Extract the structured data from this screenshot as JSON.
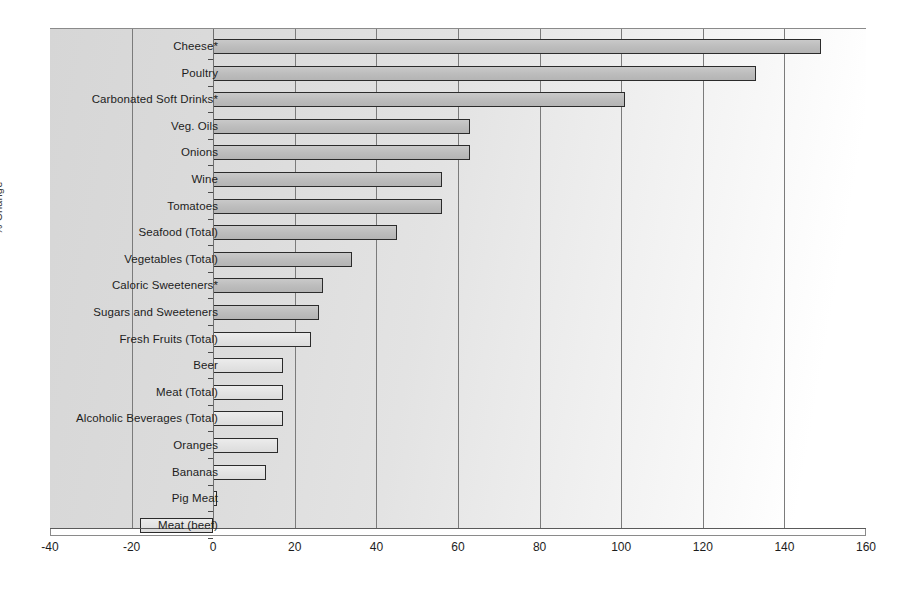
{
  "chart_data": {
    "type": "bar",
    "orientation": "horizontal",
    "title": "",
    "xlabel": "",
    "ylabel": "% Change",
    "xlim": [
      -40,
      160
    ],
    "xticks": [
      -40,
      -20,
      0,
      20,
      40,
      60,
      80,
      100,
      120,
      140,
      160
    ],
    "grid": true,
    "legend": false,
    "categories": [
      "Cheese*",
      "Poultry",
      "Carbonated Soft Drinks*",
      "Veg. Oils",
      "Onions",
      "Wine",
      "Tomatoes",
      "Seafood (Total)",
      "Vegetables (Total)",
      "Caloric Sweeteners*",
      "Sugars and Sweeteners",
      "Fresh Fruits (Total)",
      "Beer",
      "Meat (Total)",
      "Alcoholic Beverages (Total)",
      "Oranges",
      "Bananas",
      "Pig Meat",
      "Meat (beef)"
    ],
    "values": [
      149,
      133,
      101,
      63,
      63,
      56,
      56,
      45,
      34,
      27,
      26,
      24,
      17,
      17,
      17,
      16,
      13,
      1,
      -18
    ],
    "bar_color": "#bdbdbd",
    "bar_edge_color": "#2b2b2b"
  },
  "axis": {
    "tick_labels": [
      "-40",
      "-20",
      "0",
      "20",
      "40",
      "60",
      "80",
      "100",
      "120",
      "140",
      "160"
    ],
    "y_caption": "% Change"
  }
}
